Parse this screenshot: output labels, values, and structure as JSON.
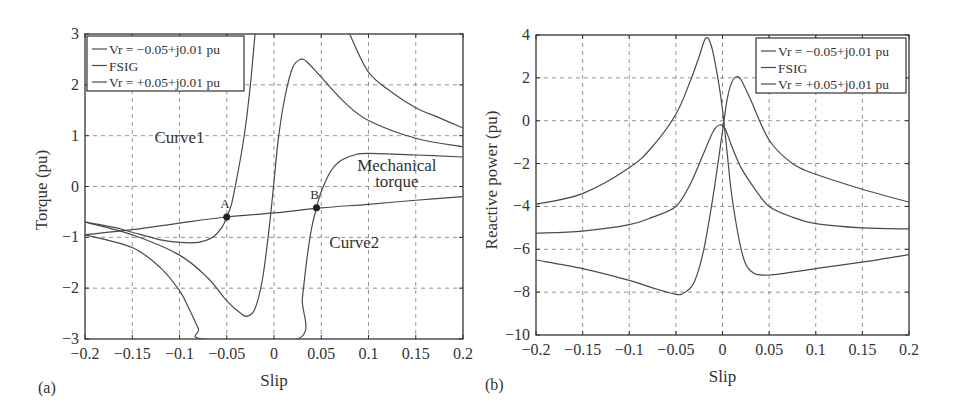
{
  "chart_data": [
    {
      "type": "line",
      "panel_label": "(a)",
      "xlabel": "Slip",
      "ylabel": "Torque (pu)",
      "xlim": [
        -0.2,
        0.2
      ],
      "ylim": [
        -3,
        3
      ],
      "xticks": [
        -0.2,
        -0.15,
        -0.1,
        -0.05,
        0,
        0.05,
        0.1,
        0.15,
        0.2
      ],
      "xtick_labels": [
        "−0.2",
        "−0.15",
        "−0.1",
        "−0.05",
        "0",
        "0.05",
        "0.1",
        "0.15",
        "0.2"
      ],
      "yticks": [
        3,
        2,
        1,
        0,
        -1,
        -2,
        -3
      ],
      "ytick_labels": [
        "3",
        "2",
        "1",
        "0",
        "−1",
        "−2",
        "−3"
      ],
      "grid": true,
      "legend_position": "upper-left",
      "legend": [
        "Vr = −0.05+j0.01 pu",
        "FSIG",
        "Vr = +0.05+j0.01 pu"
      ],
      "annotations": [
        {
          "text": "Curve1",
          "x": -0.1,
          "y": 0.85
        },
        {
          "text": "Curve2",
          "x": 0.085,
          "y": -1.2
        },
        {
          "text": "Mechanical",
          "x": 0.13,
          "y": 0.3
        },
        {
          "text": "torque",
          "x": 0.13,
          "y": 0.0
        },
        {
          "text": "A",
          "x": -0.052,
          "y": -0.42
        },
        {
          "text": "B",
          "x": 0.043,
          "y": -0.25
        }
      ],
      "points": [
        {
          "name": "A",
          "x": -0.05,
          "y": -0.6
        },
        {
          "name": "B",
          "x": 0.045,
          "y": -0.42
        }
      ],
      "series": [
        {
          "name": "Vr = −0.05+j0.01 pu (Curve1)",
          "x": [
            -0.2,
            -0.17,
            -0.15,
            -0.12,
            -0.1,
            -0.08,
            -0.065,
            -0.055,
            -0.05,
            -0.045,
            -0.04,
            -0.035,
            -0.03,
            -0.025,
            -0.022,
            -0.02,
            -0.018
          ],
          "y": [
            -0.7,
            -0.8,
            -0.9,
            -1.05,
            -1.1,
            -1.1,
            -1.0,
            -0.8,
            -0.6,
            -0.35,
            0.1,
            0.6,
            1.2,
            2.0,
            2.6,
            3.0,
            3.3
          ]
        },
        {
          "name": "FSIG",
          "x": [
            -0.2,
            -0.15,
            -0.1,
            -0.07,
            -0.05,
            -0.035,
            -0.028,
            -0.02,
            -0.012,
            -0.005,
            0.0,
            0.005,
            0.012,
            0.02,
            0.028,
            0.035,
            0.05,
            0.075,
            0.1,
            0.15,
            0.2
          ],
          "y": [
            -0.7,
            -0.95,
            -1.35,
            -1.8,
            -2.25,
            -2.5,
            -2.55,
            -2.4,
            -1.8,
            -0.8,
            0.1,
            1.0,
            1.8,
            2.35,
            2.5,
            2.45,
            2.15,
            1.65,
            1.3,
            0.95,
            0.78
          ]
        },
        {
          "name": "Vr = +0.05+j0.01 pu (Curve2)",
          "x": [
            -0.2,
            -0.15,
            -0.12,
            -0.1,
            -0.09,
            -0.08,
            -0.075,
            0.025,
            0.03,
            0.035,
            0.04,
            0.045,
            0.05,
            0.06,
            0.07,
            0.085,
            0.1,
            0.15,
            0.2
          ],
          "y": [
            -0.95,
            -1.2,
            -1.6,
            -2.05,
            -2.4,
            -2.8,
            -3.0,
            -3.0,
            -2.2,
            -1.4,
            -0.8,
            -0.42,
            -0.1,
            0.3,
            0.5,
            0.62,
            0.65,
            0.62,
            0.58
          ]
        },
        {
          "name": "Mechanical torque",
          "x": [
            -0.2,
            -0.15,
            -0.1,
            -0.05,
            0,
            0.05,
            0.1,
            0.15,
            0.2
          ],
          "y": [
            -0.95,
            -0.85,
            -0.72,
            -0.6,
            -0.52,
            -0.42,
            -0.35,
            -0.27,
            -0.2
          ]
        },
        {
          "name": "FSIG-upper-branch",
          "x": [
            0.08,
            0.1,
            0.125,
            0.15,
            0.175,
            0.2
          ],
          "y": [
            3.0,
            2.25,
            1.85,
            1.55,
            1.35,
            1.15
          ]
        }
      ]
    },
    {
      "type": "line",
      "panel_label": "(b)",
      "xlabel": "Slip",
      "ylabel": "Reactive power (pu)",
      "xlim": [
        -0.2,
        0.2
      ],
      "ylim": [
        -10,
        4
      ],
      "xticks": [
        -0.2,
        -0.15,
        -0.1,
        -0.05,
        0,
        0.05,
        0.1,
        0.15,
        0.2
      ],
      "xtick_labels": [
        "−0.2",
        "−0.15",
        "−0.1",
        "−0.05",
        "0",
        "0.05",
        "0.1",
        "0.15",
        "0.2"
      ],
      "yticks": [
        4,
        2,
        0,
        -2,
        -4,
        -6,
        -8,
        -10
      ],
      "ytick_labels": [
        "4",
        "2",
        "0",
        "−2",
        "−4",
        "−6",
        "−8",
        "−10"
      ],
      "grid": true,
      "legend_position": "upper-right",
      "legend": [
        "Vr = −0.05+j0.01 pu",
        "FSIG",
        "Vr = +0.05+j0.01 pu"
      ],
      "series": [
        {
          "name": "Vr = −0.05+j0.01 pu",
          "x": [
            -0.2,
            -0.15,
            -0.1,
            -0.075,
            -0.05,
            -0.035,
            -0.025,
            -0.018,
            -0.012,
            -0.005,
            0.0,
            0.005,
            0.01,
            0.02,
            0.03,
            0.05,
            0.1,
            0.15,
            0.2
          ],
          "y": [
            -3.9,
            -3.4,
            -2.2,
            -1.2,
            0.3,
            1.8,
            3.0,
            3.85,
            3.5,
            2.0,
            0.5,
            -1.5,
            -3.5,
            -6.0,
            -7.0,
            -7.2,
            -6.9,
            -6.6,
            -6.25
          ]
        },
        {
          "name": "FSIG",
          "x": [
            -0.2,
            -0.15,
            -0.1,
            -0.075,
            -0.05,
            -0.035,
            -0.02,
            -0.01,
            -0.003,
            0.003,
            0.01,
            0.02,
            0.035,
            0.05,
            0.075,
            0.1,
            0.15,
            0.2
          ],
          "y": [
            -5.25,
            -5.15,
            -4.85,
            -4.5,
            -4.0,
            -3.0,
            -1.5,
            -0.5,
            -0.2,
            -0.4,
            -1.2,
            -2.2,
            -3.2,
            -4.0,
            -4.5,
            -4.8,
            -5.0,
            -5.05
          ]
        },
        {
          "name": "Vr = +0.05+j0.01 pu",
          "x": [
            -0.2,
            -0.15,
            -0.1,
            -0.075,
            -0.05,
            -0.04,
            -0.03,
            -0.02,
            -0.01,
            0.0,
            0.005,
            0.01,
            0.015,
            0.02,
            0.03,
            0.05,
            0.075,
            0.1,
            0.15,
            0.2
          ],
          "y": [
            -6.5,
            -6.9,
            -7.45,
            -7.8,
            -8.1,
            -8.0,
            -7.5,
            -6.0,
            -3.5,
            -0.5,
            1.0,
            1.8,
            2.05,
            1.9,
            1.0,
            -0.9,
            -2.0,
            -2.5,
            -3.2,
            -3.8
          ]
        }
      ]
    }
  ]
}
